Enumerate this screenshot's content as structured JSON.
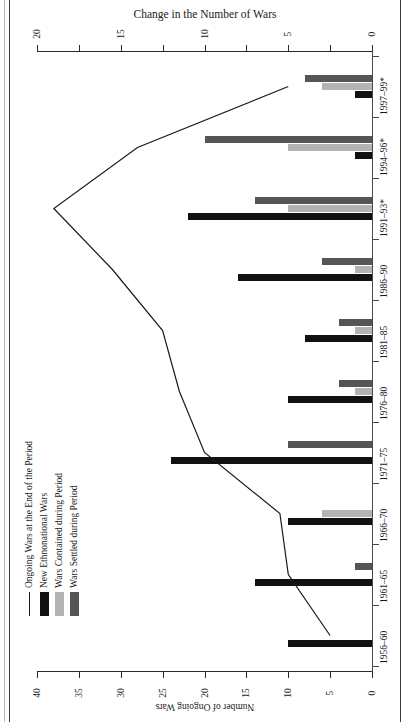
{
  "figure": {
    "caption_fragment": "Figure 7.1. Trends in Ethnonational Wars for Self-Determination, 1956–1999"
  },
  "chart_data": {
    "type": "bar",
    "orientation": "rotated-90-horizontal-bars",
    "title": "",
    "categories": [
      "1956–60",
      "1961–65",
      "1966–70",
      "1971–75",
      "1976–80",
      "1981–85",
      "1986–90",
      "1991–93*",
      "1994–96*",
      "1997–99*"
    ],
    "series": [
      {
        "name": "New Ethnonational Wars",
        "kind": "bar",
        "color": "#111111",
        "axis": "change",
        "values": [
          5,
          7,
          5,
          12,
          5,
          4,
          8,
          11,
          1,
          1
        ]
      },
      {
        "name": "Wars Contained during Period",
        "kind": "bar",
        "color": "#b3b3b3",
        "axis": "change",
        "values": [
          0,
          0,
          3,
          0,
          1,
          1,
          1,
          5,
          5,
          3
        ]
      },
      {
        "name": "Wars Settled during Period",
        "kind": "bar",
        "color": "#555555",
        "axis": "change",
        "values": [
          0,
          1,
          0,
          5,
          2,
          2,
          3,
          7,
          10,
          4
        ]
      },
      {
        "name": "Ongoing Wars at the End of the Period",
        "kind": "line",
        "color": "#1a1a1a",
        "axis": "ongoing",
        "values": [
          5,
          10,
          11,
          20,
          23,
          25,
          31,
          38,
          28,
          10
        ]
      }
    ],
    "axes": {
      "change": {
        "label": "Change in the Number of Wars",
        "position": "top",
        "min": 0,
        "max": 20,
        "ticks": [
          20,
          15,
          10,
          5,
          0
        ],
        "minor_ticks": [
          20,
          17.5,
          15,
          12.5,
          10,
          7.5,
          5,
          2.5,
          0
        ],
        "direction": "right-to-left"
      },
      "ongoing": {
        "label": "Number of Ongoing Wars",
        "position": "bottom",
        "min": 0,
        "max": 40,
        "ticks": [
          40,
          35,
          30,
          25,
          20,
          15,
          10,
          5,
          0
        ],
        "direction": "right-to-left"
      },
      "category": {
        "label": "",
        "position": "right"
      }
    },
    "grid": false,
    "legend": {
      "position": "left-middle",
      "entries": [
        {
          "label": "Ongoing Wars at the End of the Period",
          "swatch": "line",
          "color": "#1a1a1a"
        },
        {
          "label": "New Ethnonational Wars",
          "swatch": "box",
          "color": "#111111"
        },
        {
          "label": "Wars Contained during Period",
          "swatch": "box",
          "color": "#b3b3b3"
        },
        {
          "label": "Wars Settled during Period",
          "swatch": "box",
          "color": "#555555"
        }
      ]
    }
  }
}
